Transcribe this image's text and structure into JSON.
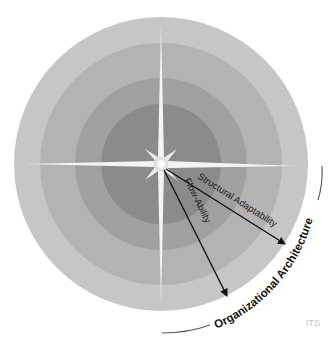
{
  "diagram": {
    "center": {
      "x": 161,
      "y": 164
    },
    "rings": [
      {
        "r": 147,
        "color": "#c4c4c4"
      },
      {
        "r": 121,
        "color": "#b1b1b1"
      },
      {
        "r": 86,
        "color": "#9f9f9f"
      },
      {
        "r": 60,
        "color": "#8a8a8a"
      }
    ],
    "arrows": [
      {
        "label": "Structural Adaptability",
        "to": {
          "x": 287,
          "y": 246
        }
      },
      {
        "label": "Flow-Ability",
        "to": {
          "x": 228,
          "y": 298
        }
      }
    ],
    "outer_label": "Organizational Architecture",
    "watermark": "ITS"
  }
}
